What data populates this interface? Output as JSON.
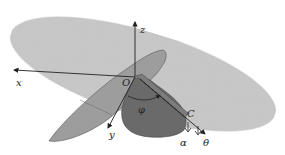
{
  "diagram": {
    "type": "3d-geometry",
    "colors": {
      "large_plane": "#c9c9c9",
      "light_lobe": "#9d9d9d",
      "dark_lobe": "#6a6a6a",
      "strip": "#7c7c7c",
      "axis": "#222222"
    },
    "labels": {
      "x": "x",
      "y": "y",
      "z": "z",
      "origin": "O",
      "phi": "φ",
      "alpha": "α",
      "theta": "θ",
      "point_c": "C"
    }
  }
}
